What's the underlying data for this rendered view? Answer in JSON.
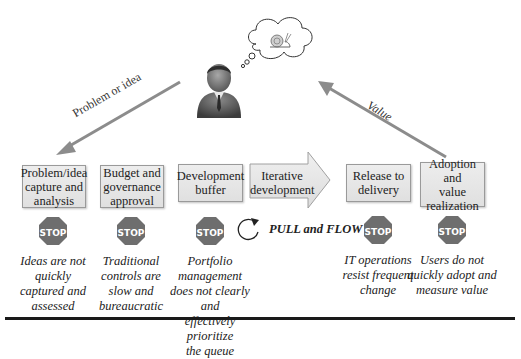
{
  "diagram": {
    "top_arrows": {
      "left_label": "Problem or idea",
      "right_label": "Value"
    },
    "person": {
      "icon": "business-person-icon",
      "thought": "snail-thought-bubble-icon"
    },
    "stages": [
      {
        "label": "Problem/idea capture and analysis",
        "lines": [
          "Problem/idea",
          "capture and",
          "analysis"
        ],
        "has_stop": true,
        "note": [
          "Ideas are not",
          "quickly",
          "captured and",
          "assessed"
        ]
      },
      {
        "label": "Budget and governance approval",
        "lines": [
          "Budget and",
          "governance",
          "approval"
        ],
        "has_stop": true,
        "note": [
          "Traditional",
          "controls are",
          "slow and",
          "bureaucratic"
        ]
      },
      {
        "label": "Development buffer",
        "lines": [
          "Development",
          "buffer"
        ],
        "has_stop": true,
        "note": [
          "Portfolio management",
          "does not clearly and",
          "effectively prioritize",
          "the queue"
        ]
      },
      {
        "label": "Iterative development",
        "lines": [
          "Iterative",
          "development"
        ],
        "has_stop": false,
        "shape": "arrow"
      },
      {
        "label": "Release to delivery",
        "lines": [
          "Release to",
          "delivery"
        ],
        "has_stop": true,
        "note": [
          "IT operations",
          "resist frequent",
          "change"
        ]
      },
      {
        "label": "Adoption and value realization",
        "lines": [
          "Adoption and",
          "value",
          "realization"
        ],
        "has_stop": true,
        "note": [
          "Users do not",
          "quickly adopt and",
          "measure value"
        ]
      }
    ],
    "stop_sign_text": "STOP",
    "pull_and_flow": "PULL and FLOW",
    "colors": {
      "box_fill": "#e6e6e6",
      "box_border": "#9a9a9a",
      "stop_fill": "#6e6e6e",
      "arrow_gray": "#8c8c8c",
      "rule": "#1a1a1a"
    }
  }
}
